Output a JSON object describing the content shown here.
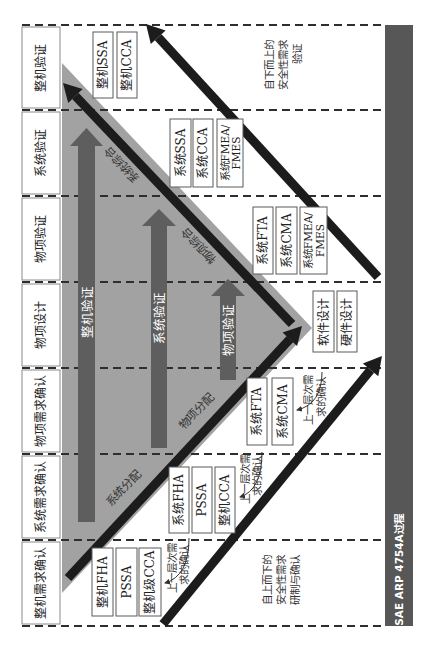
{
  "rows": [
    {
      "label": "整机验证",
      "boxes": [
        {
          "lines": [
            "整机SSA"
          ]
        },
        {
          "lines": [
            "整机CCA"
          ]
        }
      ]
    },
    {
      "label": "系统验证",
      "boxes": [
        {
          "lines": [
            "系统SSA"
          ]
        },
        {
          "lines": [
            "系统CCA"
          ]
        },
        {
          "lines": [
            "系统FMEA/",
            "FMES"
          ]
        }
      ]
    },
    {
      "label": "物项验证",
      "boxes": [
        {
          "lines": [
            "系统FTA"
          ]
        },
        {
          "lines": [
            "系统CMA"
          ]
        },
        {
          "lines": [
            "系统FMEA/",
            "FMES"
          ]
        }
      ]
    },
    {
      "label": "物项设计",
      "boxes": [
        {
          "lines": [
            "软件设计"
          ]
        },
        {
          "lines": [
            "硬件设计"
          ]
        }
      ]
    },
    {
      "label": "物项需求确认",
      "boxes": [
        {
          "lines": [
            "系统FTA"
          ]
        },
        {
          "lines": [
            "系统CMA"
          ]
        }
      ],
      "note": [
        "上一层次需",
        "求的确认"
      ]
    },
    {
      "label": "系统需求确认",
      "boxes": [
        {
          "lines": [
            "系统FHA"
          ]
        },
        {
          "lines": [
            "PSSA"
          ]
        },
        {
          "lines": [
            "整机CCA"
          ]
        }
      ],
      "note": [
        "上一层次需",
        "求的确认"
      ]
    },
    {
      "label": "整机需求确认",
      "boxes": [
        {
          "lines": [
            "整机FHA"
          ]
        },
        {
          "lines": [
            "PSSA"
          ]
        },
        {
          "lines": [
            "整机级CCA"
          ]
        }
      ],
      "note": [
        "上一层次需",
        "求的确认"
      ]
    }
  ],
  "verification_arrows": [
    {
      "label": "整机验证"
    },
    {
      "label": "系统验证"
    },
    {
      "label": "物项验证"
    }
  ],
  "diagonal_labels": {
    "system_integration": "系统综合",
    "item_integration": "物项综合",
    "system_allocation": "系统分配",
    "item_allocation": "物项分配"
  },
  "annotations": {
    "bottom_up": [
      "自下而上的",
      "安全性需求",
      "验证"
    ],
    "top_down": [
      "自上而下的",
      "安全性需求",
      "研制与确认"
    ]
  },
  "process_bar": {
    "label": "SAE ARP 4754A过程"
  },
  "colors": {
    "triangle": "#a2a2a2",
    "verification_arrow": "#5e5e5e",
    "flow_arrow": "#1c1c1c",
    "process_bar": "#575757"
  }
}
